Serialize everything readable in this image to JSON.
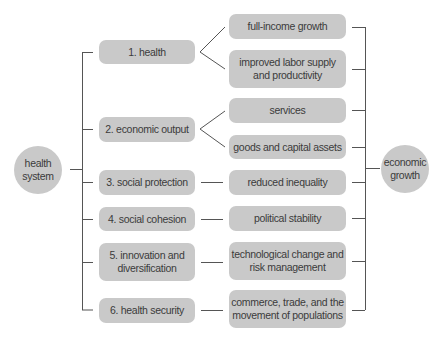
{
  "diagram": {
    "source_node": "health system",
    "target_node": "economic growth",
    "channels": [
      {
        "label": "1. health",
        "outcomes": [
          "full-income growth",
          "improved labor supply and productivity"
        ]
      },
      {
        "label": "2. economic output",
        "outcomes": [
          "services",
          "goods and capital assets"
        ]
      },
      {
        "label": "3. social protection",
        "outcomes": [
          "reduced inequality"
        ]
      },
      {
        "label": "4. social cohesion",
        "outcomes": [
          "political stability"
        ]
      },
      {
        "label": "5. innovation and diversification",
        "outcomes": [
          "technological change and risk management"
        ]
      },
      {
        "label": "6. health security",
        "outcomes": [
          "commerce, trade, and the movement of populations"
        ]
      }
    ]
  },
  "nodes": {
    "left_circle": {
      "line1": "health",
      "line2": "system"
    },
    "right_circle": {
      "line1": "economic",
      "line2": "growth"
    },
    "channels": {
      "c1": "1. health",
      "c2": "2. economic output",
      "c3": "3. social protection",
      "c4": "4. social cohesion",
      "c5a": "5. innovation and",
      "c5b": "diversification",
      "c6": "6. health security"
    },
    "outcomes": {
      "o1": "full-income growth",
      "o2a": "improved labor supply",
      "o2b": "and productivity",
      "o3": "services",
      "o4": "goods and capital assets",
      "o5": "reduced inequality",
      "o6": "political stability",
      "o7a": "technological change and",
      "o7b": "risk management",
      "o8a": "commerce, trade, and the",
      "o8b": "movement of populations"
    }
  },
  "colors": {
    "node_fill": "#c9c9c9",
    "line": "#555555",
    "text": "#3b3b3b"
  }
}
